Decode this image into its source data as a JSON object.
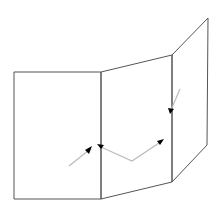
{
  "canvas": {
    "width": 220,
    "height": 208,
    "background": "#ffffff"
  },
  "colors": {
    "panel_stroke": "#555555",
    "ray": "#bbbbbb",
    "arrowhead": "#000000"
  },
  "panels": [
    {
      "name": "left-panel",
      "points": "14,72 101,72 101,199 14,199"
    },
    {
      "name": "middle-panel",
      "points": "101,72 172,55 172,182 101,199"
    },
    {
      "name": "right-panel",
      "points": "172,55 208,18 207,145 172,182"
    }
  ],
  "rays": [
    {
      "name": "incoming-ray",
      "points": "69,166 89,150"
    },
    {
      "name": "reflected-ray",
      "points": "101,147 132,161 162,141"
    },
    {
      "name": "right-incoming-ray",
      "points": "180,89 171,110"
    }
  ],
  "arrowheads": [
    {
      "name": "arrowhead-left-incoming",
      "points": "92,146 85,150 89,154"
    },
    {
      "name": "arrowhead-fold-middle",
      "points": "97,144 104,145 101,149"
    },
    {
      "name": "arrowhead-reflected",
      "points": "164,139 157,141 160,145"
    },
    {
      "name": "arrowhead-right-fold",
      "points": "170,114 168,108 174,109"
    }
  ]
}
